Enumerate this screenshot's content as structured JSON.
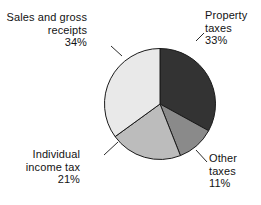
{
  "chart_data": {
    "type": "pie",
    "title": "",
    "subtitle": "",
    "xlabel": "",
    "ylabel": "",
    "legend_position": "none",
    "grid": false,
    "start_angle_deg": 0,
    "direction": "clockwise",
    "categories": [
      "Property taxes",
      "Other taxes",
      "Individual income tax",
      "Sales and gross receipts"
    ],
    "values": [
      33,
      11,
      21,
      34
    ],
    "value_unit": "%",
    "slices": [
      {
        "name": "property-taxes",
        "label_line1": "Property",
        "label_line2": "taxes",
        "value": 33,
        "value_text": "33%",
        "color": "#333333",
        "start_deg": 0,
        "end_deg": 118.8
      },
      {
        "name": "other-taxes",
        "label_line1": "Other",
        "label_line2": "taxes",
        "value": 11,
        "value_text": "11%",
        "color": "#8a8a8a",
        "start_deg": 118.8,
        "end_deg": 158.4
      },
      {
        "name": "individual-income-tax",
        "label_line1": "Individual",
        "label_line2": "income tax",
        "value": 21,
        "value_text": "21%",
        "color": "#bcbcbc",
        "start_deg": 158.4,
        "end_deg": 234.0
      },
      {
        "name": "sales-and-gross-receipts",
        "label_line1": "Sales and gross",
        "label_line2": "receipts",
        "value": 34,
        "value_text": "34%",
        "color": "#e9e9e9",
        "start_deg": 234.0,
        "end_deg": 360.0
      }
    ],
    "outline_color": "#1a1a1a",
    "leader_line_color": "#2b2b2b",
    "background_color": "#ffffff"
  }
}
